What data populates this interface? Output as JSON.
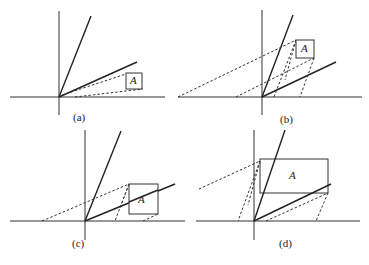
{
  "panels": [
    {
      "id": "a",
      "caption": "(a)",
      "box_label": "A"
    },
    {
      "id": "b",
      "caption": "(b)",
      "box_label": "A"
    },
    {
      "id": "c",
      "caption": "(c)",
      "box_label": "A"
    },
    {
      "id": "d",
      "caption": "(d)",
      "box_label": "A"
    }
  ]
}
